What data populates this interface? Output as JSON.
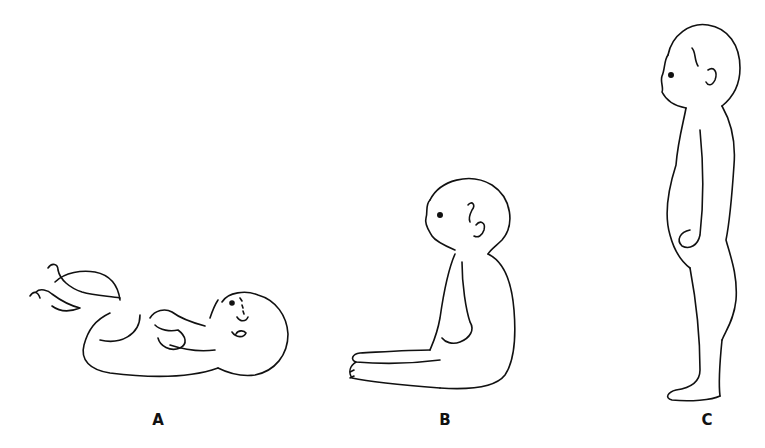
{
  "figure": {
    "panels": [
      {
        "label": "A",
        "description": "infant lying supine with flexed limbs",
        "label_x": 158,
        "label_y": 411
      },
      {
        "label": "B",
        "description": "infant sitting with rounded back",
        "label_x": 445,
        "label_y": 411
      },
      {
        "label": "C",
        "description": "toddler standing, side view",
        "label_x": 707,
        "label_y": 411
      }
    ]
  }
}
